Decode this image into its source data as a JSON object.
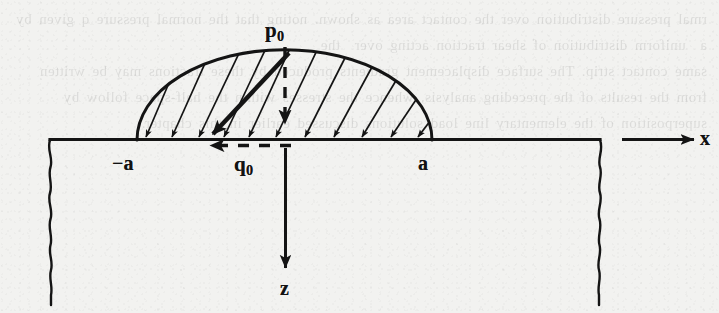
{
  "figure": {
    "background_color": "#f2f2f0",
    "ink_color": "#141414",
    "labels": {
      "peak_pressure": {
        "symbol": "p",
        "subscript": "0",
        "text": "p0"
      },
      "peak_shear": {
        "symbol": "q",
        "subscript": "0",
        "text": "q0"
      },
      "left_contact_edge": "−a",
      "right_contact_edge": "a",
      "horizontal_axis": "x",
      "vertical_axis": "z"
    },
    "geometry": {
      "surface_line_y": 140,
      "contact_left_x": 137,
      "contact_right_x": 432,
      "contact_center_x": 285,
      "arc_apex_y": 50,
      "semi_axis_a_px": 147,
      "semi_axis_p0_px": 90,
      "surface_line_start_x": 50,
      "surface_line_end_x": 600,
      "x_axis_arrow_start_x": 622,
      "x_axis_arrow_end_x": 694,
      "z_axis_arrow_top_y": 145,
      "z_axis_arrow_bottom_y": 270,
      "left_break_x": 50,
      "right_break_x": 600,
      "break_bottom_y": 305
    },
    "elements": {
      "pressure_arc": "elliptical normal pressure ordinate curve",
      "hatch_arrows": "12 inclined hatch lines each terminating in an arrowhead on the surface",
      "p0_dashed_arrow": "vertical dashed arrow from arc apex down to surface",
      "q0_dashed_arrow": "horizontal dashed arrow pointing in the negative x direction just below the surface",
      "left_break": "wavy freehand break line bounding the half-space on the left",
      "right_break": "wavy freehand break line bounding the half-space on the right"
    },
    "hatch_arrow_count": 12
  },
  "bleed_through": {
    "ghost_text": "rmal pressure distribution over the contact area as shown. noting that the normal pressure q given by  a  uniform distribution of shear traction acting over  the\nsame contact strip. The surface displacement gradients produced by these tractions may be written from the results of the preceding analysis, whence the stresses within the half-space follow by superposition of the elementary line load solutions discussed earlier in this chapter."
  }
}
